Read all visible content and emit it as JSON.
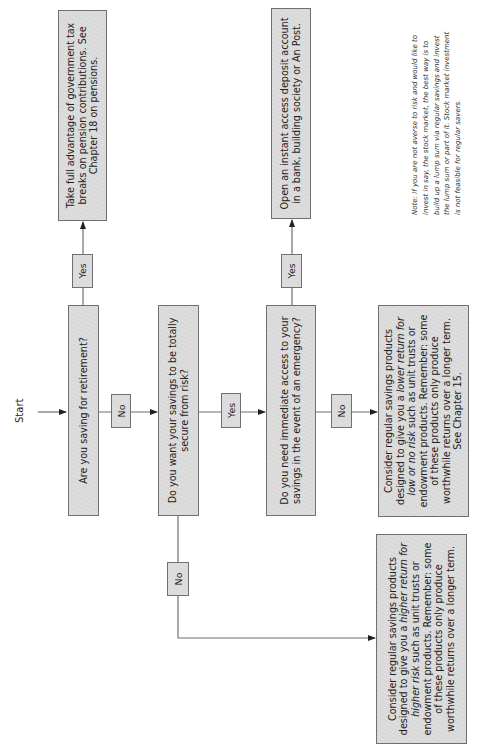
{
  "flowchart": {
    "start_label": "Start",
    "nodes": {
      "q_retirement": "Are you saving for retirement?",
      "q_secure": "Do you want your savings to be totally secure from risk?",
      "q_emergency": "Do you need immediate access to your savings in the event of an emergency?",
      "a_pension": "Take full advantage of government tax breaks on pension contributions. See Chapter 18 on pensions.",
      "a_instant_access": "Open an instant access deposit account in a bank, building society or An Post.",
      "a_lower_return": {
        "pre": "Consider regular savings products designed to give you a ",
        "italic": "lower return for low or no risk",
        "post": " such as unit trusts or endowment products. Remember: some of these products only produce worthwhile returns over a longer term. See Chapter 15."
      },
      "a_higher_return": {
        "pre": "Consider regular savings products designed to give you a ",
        "italic": "higher return for higher risk",
        "post": " such as unit trusts or endowment products. Remember: some of these products only produce worthwhile returns over a longer term."
      }
    },
    "edges": {
      "retirement_yes": "Yes",
      "retirement_no": "No",
      "secure_yes": "Yes",
      "secure_no": "No",
      "emergency_yes": "Yes",
      "emergency_no": "No"
    },
    "note": "Note: If you are not averse to risk and would like to invest in say, the stock market, the best way is to build up a lump sum via regular savings and invest the lump sum or part of it. Stock market investment is not feasible for regular savers."
  },
  "colors": {
    "box_fill": "#d9d9d9",
    "box_border": "#707070",
    "line": "#707070"
  }
}
